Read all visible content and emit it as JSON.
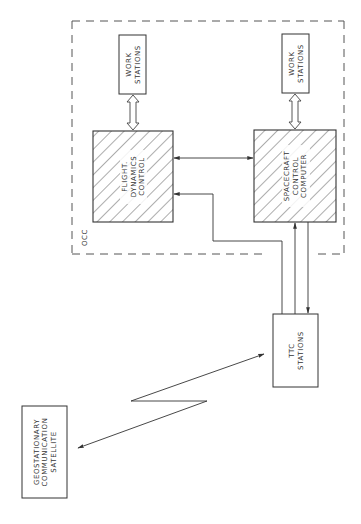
{
  "diagram": {
    "stroke_color": "#3a3a3a",
    "background": "#ffffff",
    "occ_boundary": {
      "label": "OCC",
      "style": "dashed"
    },
    "nodes": {
      "work_stations_left": {
        "lines": [
          "WORK",
          "STATIONS"
        ]
      },
      "work_stations_right": {
        "lines": [
          "WORK",
          "STATIONS"
        ]
      },
      "flight_dynamics": {
        "lines": [
          "FLIGHT.",
          "DYNAMICS",
          "CONTROL"
        ],
        "fill": "hatched"
      },
      "spacecraft_computer": {
        "lines": [
          "SPACECRAFT",
          "CONTROL",
          "COMPUTER"
        ],
        "fill": "hatched"
      },
      "ttc_stations": {
        "lines": [
          "TTC",
          "STATIONS"
        ]
      },
      "satellite": {
        "lines": [
          "GEOSTATIONARY",
          "COMMUNICATION",
          "SATELLITE"
        ]
      }
    },
    "connections": [
      {
        "from": "work_stations_left",
        "to": "flight_dynamics",
        "type": "hollow-double-arrow"
      },
      {
        "from": "work_stations_right",
        "to": "spacecraft_computer",
        "type": "hollow-double-arrow"
      },
      {
        "from": "flight_dynamics",
        "to": "spacecraft_computer",
        "type": "bidirectional"
      },
      {
        "from": "ttc_stations",
        "to": "flight_dynamics",
        "type": "arrow"
      },
      {
        "from": "ttc_stations",
        "to": "spacecraft_computer",
        "type": "arrow"
      },
      {
        "from": "spacecraft_computer",
        "to": "ttc_stations",
        "type": "arrow"
      },
      {
        "from": "ttc_stations",
        "to": "satellite",
        "type": "radio-link-bidirectional"
      }
    ]
  }
}
